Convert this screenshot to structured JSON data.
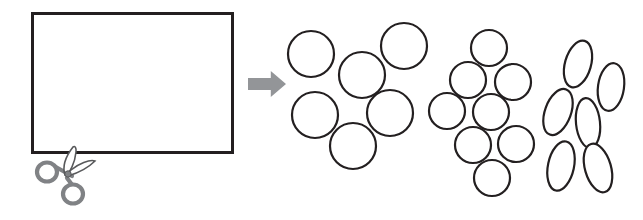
{
  "figure": {
    "canvas": {
      "width": 643,
      "height": 220,
      "background": "#ffffff"
    },
    "palette": {
      "outline": "#231f20",
      "fill": "#ffffff",
      "arrow": "#939598",
      "scissors_handle": "#808285",
      "scissors_blade": "#58595b"
    }
  },
  "source_panel": {
    "label": "packed-sheet",
    "frame": {
      "x": 31,
      "y": 12,
      "width": 203,
      "height": 142,
      "stroke_width": 3
    },
    "regions": [
      {
        "name": "large-circles-region",
        "shape_kind": "circle",
        "count": 6,
        "columns": 2,
        "rows": 3,
        "radius": 24
      },
      {
        "name": "medium-circles-region",
        "shape_kind": "circle",
        "count": 8,
        "columns": 2,
        "rows": 4,
        "radius": 18
      },
      {
        "name": "tall-ellipses-region",
        "shape_kind": "ellipse",
        "count": 6,
        "columns": 2,
        "rows": 3,
        "rx": 13,
        "ry": 24
      }
    ],
    "shapes": [
      {
        "name": "large-circle",
        "type": "circle",
        "cx": 73,
        "cy": 37,
        "r": 25
      },
      {
        "name": "large-circle",
        "type": "circle",
        "cx": 123,
        "cy": 37,
        "r": 25
      },
      {
        "name": "large-circle",
        "type": "circle",
        "cx": 73,
        "cy": 85,
        "r": 25
      },
      {
        "name": "large-circle",
        "type": "circle",
        "cx": 123,
        "cy": 85,
        "r": 25
      },
      {
        "name": "large-circle",
        "type": "circle",
        "cx": 73,
        "cy": 131,
        "r": 25
      },
      {
        "name": "large-circle",
        "type": "circle",
        "cx": 123,
        "cy": 131,
        "r": 25
      },
      {
        "name": "medium-circle",
        "type": "circle",
        "cx": 164,
        "cy": 31,
        "r": 19
      },
      {
        "name": "medium-circle",
        "type": "circle",
        "cx": 164,
        "cy": 68,
        "r": 19
      },
      {
        "name": "medium-circle",
        "type": "circle",
        "cx": 164,
        "cy": 104,
        "r": 19
      },
      {
        "name": "medium-circle",
        "type": "circle",
        "cx": 164,
        "cy": 138,
        "r": 19
      },
      {
        "name": "medium-circle",
        "type": "circle",
        "cx": 200,
        "cy": 31,
        "r": 19
      },
      {
        "name": "medium-circle",
        "type": "circle",
        "cx": 200,
        "cy": 68,
        "r": 19
      },
      {
        "name": "medium-circle",
        "type": "circle",
        "cx": 200,
        "cy": 104,
        "r": 19
      },
      {
        "name": "medium-circle",
        "type": "circle",
        "cx": 200,
        "cy": 138,
        "r": 19
      },
      {
        "name": "tall-ellipse",
        "type": "ellipse",
        "cx": 196,
        "cy": 39,
        "rx": 13,
        "ry": 25
      },
      {
        "name": "tall-ellipse",
        "type": "ellipse",
        "cx": 196,
        "cy": 86,
        "rx": 13,
        "ry": 25
      },
      {
        "name": "tall-ellipse",
        "type": "ellipse",
        "cx": 196,
        "cy": 130,
        "rx": 13,
        "ry": 25
      },
      {
        "name": "tall-ellipse",
        "type": "ellipse",
        "cx": 222,
        "cy": 39,
        "rx": 13,
        "ry": 25
      },
      {
        "name": "tall-ellipse",
        "type": "ellipse",
        "cx": 222,
        "cy": 86,
        "rx": 13,
        "ry": 25
      },
      {
        "name": "tall-ellipse",
        "type": "ellipse",
        "cx": 222,
        "cy": 130,
        "rx": 13,
        "ry": 25
      }
    ]
  },
  "scissors": {
    "name": "scissors",
    "position": {
      "x": 34,
      "y": 148,
      "width": 70,
      "height": 62
    },
    "pivot": {
      "cx": 69,
      "cy": 173
    },
    "handles": [
      {
        "name": "scissors-ring-left",
        "cx": 47,
        "cy": 172,
        "rx": 10,
        "ry": 9.5
      },
      {
        "name": "scissors-ring-lower",
        "cx": 73,
        "cy": 194,
        "rx": 10,
        "ry": 9.5
      }
    ]
  },
  "arrow": {
    "name": "process-arrow",
    "direction": "right",
    "x": 248,
    "y": 71,
    "width": 38,
    "height": 26,
    "color": "#939598"
  },
  "result_clusters": [
    {
      "name": "cluster-large-circles",
      "index": 1,
      "shape_kind": "circle",
      "count": 6,
      "shapes": [
        {
          "type": "circle",
          "cx": 311,
          "cy": 54,
          "r": 23
        },
        {
          "type": "circle",
          "cx": 362,
          "cy": 75,
          "r": 23
        },
        {
          "type": "circle",
          "cx": 404,
          "cy": 46,
          "r": 23
        },
        {
          "type": "circle",
          "cx": 315,
          "cy": 115,
          "r": 23
        },
        {
          "type": "circle",
          "cx": 390,
          "cy": 113,
          "r": 23
        },
        {
          "type": "circle",
          "cx": 353,
          "cy": 146,
          "r": 23
        }
      ]
    },
    {
      "name": "cluster-medium-circles",
      "index": 2,
      "shape_kind": "circle",
      "count": 8,
      "shapes": [
        {
          "type": "circle",
          "cx": 489,
          "cy": 48,
          "r": 18
        },
        {
          "type": "circle",
          "cx": 468,
          "cy": 80,
          "r": 18
        },
        {
          "type": "circle",
          "cx": 513,
          "cy": 82,
          "r": 18
        },
        {
          "type": "circle",
          "cx": 447,
          "cy": 111,
          "r": 18
        },
        {
          "type": "circle",
          "cx": 491,
          "cy": 112,
          "r": 18
        },
        {
          "type": "circle",
          "cx": 473,
          "cy": 145,
          "r": 18
        },
        {
          "type": "circle",
          "cx": 516,
          "cy": 144,
          "r": 18
        },
        {
          "type": "circle",
          "cx": 492,
          "cy": 178,
          "r": 18
        }
      ]
    },
    {
      "name": "cluster-tall-ellipses",
      "index": 3,
      "shape_kind": "ellipse",
      "count": 6,
      "shapes": [
        {
          "type": "ellipse",
          "cx": 578,
          "cy": 64,
          "rx": 13,
          "ry": 24,
          "rotate": 16
        },
        {
          "type": "ellipse",
          "cx": 611,
          "cy": 87,
          "rx": 13,
          "ry": 24,
          "rotate": 8
        },
        {
          "type": "ellipse",
          "cx": 558,
          "cy": 112,
          "rx": 13,
          "ry": 24,
          "rotate": 20
        },
        {
          "type": "ellipse",
          "cx": 588,
          "cy": 123,
          "rx": 12,
          "ry": 25,
          "rotate": -6
        },
        {
          "type": "ellipse",
          "cx": 561,
          "cy": 166,
          "rx": 13,
          "ry": 25,
          "rotate": 12
        },
        {
          "type": "ellipse",
          "cx": 598,
          "cy": 168,
          "rx": 13,
          "ry": 25,
          "rotate": -16
        }
      ]
    }
  ]
}
